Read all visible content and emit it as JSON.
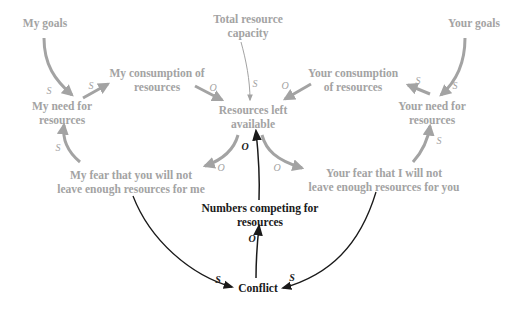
{
  "colors": {
    "gray": "#a3a3a3",
    "dark": "#1a1a1a"
  },
  "nodes": {
    "my_goals": "My goals",
    "total_capacity_1": "Total resource",
    "total_capacity_2": "capacity",
    "your_goals": "Your goals",
    "my_consumption_1": "My consumption of",
    "my_consumption_2": "resources",
    "your_consumption_1": "Your consumption",
    "your_consumption_2": "of resources",
    "my_need_1": "My need for",
    "my_need_2": "resources",
    "resources_left_1": "Resources left",
    "resources_left_2": "available",
    "your_need_1": "Your need for",
    "your_need_2": "resources",
    "my_fear_1": "My fear that you will not",
    "my_fear_2": "leave enough resources for me",
    "your_fear_1": "Your fear that I will not",
    "your_fear_2": "leave enough resources for you",
    "numbers_1": "Numbers competing for",
    "numbers_2": "resources",
    "conflict": "Conflict"
  },
  "polarities": {
    "goals_to_my_need": "S",
    "my_need_to_consumption": "S",
    "my_consumption_to_left": "O",
    "capacity_to_left": "S",
    "your_consumption_to_left": "O",
    "your_need_to_consumption": "S",
    "your_goals_to_need": "S",
    "my_fear_to_need": "S",
    "left_to_my_fear": "O",
    "numbers_to_left": "O",
    "left_to_your_fear": "O",
    "your_fear_to_need": "S",
    "conflict_to_numbers": "O",
    "my_fear_to_conflict": "S",
    "your_fear_to_conflict": "S"
  }
}
